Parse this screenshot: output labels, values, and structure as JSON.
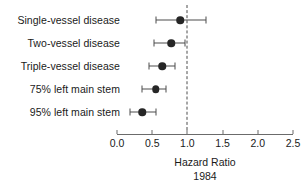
{
  "chart_data": {
    "type": "scatter",
    "subtype": "forest-plot",
    "title": "",
    "xlabel": "Hazard Ratio",
    "xlabel_sub": "1984",
    "ylabel": "",
    "xlim": [
      0.0,
      2.5
    ],
    "xticks": [
      0.0,
      0.5,
      1.0,
      1.5,
      2.0,
      2.5
    ],
    "xticklabels": [
      "0.0",
      "0.5",
      "1.0",
      "1.5",
      "2.0",
      "2.5"
    ],
    "grid": false,
    "legend": null,
    "reference_line": {
      "value": 1.0,
      "style": "dashed",
      "color": "#4c4c4c"
    },
    "marker": {
      "shape": "circle",
      "color": "#262626",
      "size_px": 7.5
    },
    "error_bar": {
      "color": "#4c4c4c",
      "cap": true
    },
    "categories": [
      "Single-vessel disease",
      "Two-vessel disease",
      "Triple-vessel disease",
      "75% left main stem",
      "95% left main stem"
    ],
    "values": [
      0.9,
      0.77,
      0.64,
      0.55,
      0.36
    ],
    "ci_low": [
      0.56,
      0.52,
      0.45,
      0.36,
      0.18
    ],
    "ci_high": [
      1.27,
      0.96,
      0.82,
      0.7,
      0.56
    ],
    "points": [
      {
        "label": "Single-vessel disease",
        "hazard_ratio": 0.9,
        "ci_low": 0.56,
        "ci_high": 1.27
      },
      {
        "label": "Two-vessel disease",
        "hazard_ratio": 0.77,
        "ci_low": 0.52,
        "ci_high": 0.96
      },
      {
        "label": "Triple-vessel disease",
        "hazard_ratio": 0.64,
        "ci_low": 0.45,
        "ci_high": 0.82
      },
      {
        "label": "75% left main stem",
        "hazard_ratio": 0.55,
        "ci_low": 0.36,
        "ci_high": 0.7
      },
      {
        "label": "95% left main stem",
        "hazard_ratio": 0.36,
        "ci_low": 0.18,
        "ci_high": 0.56
      }
    ]
  },
  "axis": {
    "title": "Hazard Ratio",
    "subtitle": "1984"
  },
  "colors": {
    "marker": "#262626",
    "error_bar": "#4c4c4c",
    "axis": "#6b6b6b",
    "reference_line": "#4c4c4c",
    "text": "#1a1a1a",
    "background": "#ffffff"
  }
}
